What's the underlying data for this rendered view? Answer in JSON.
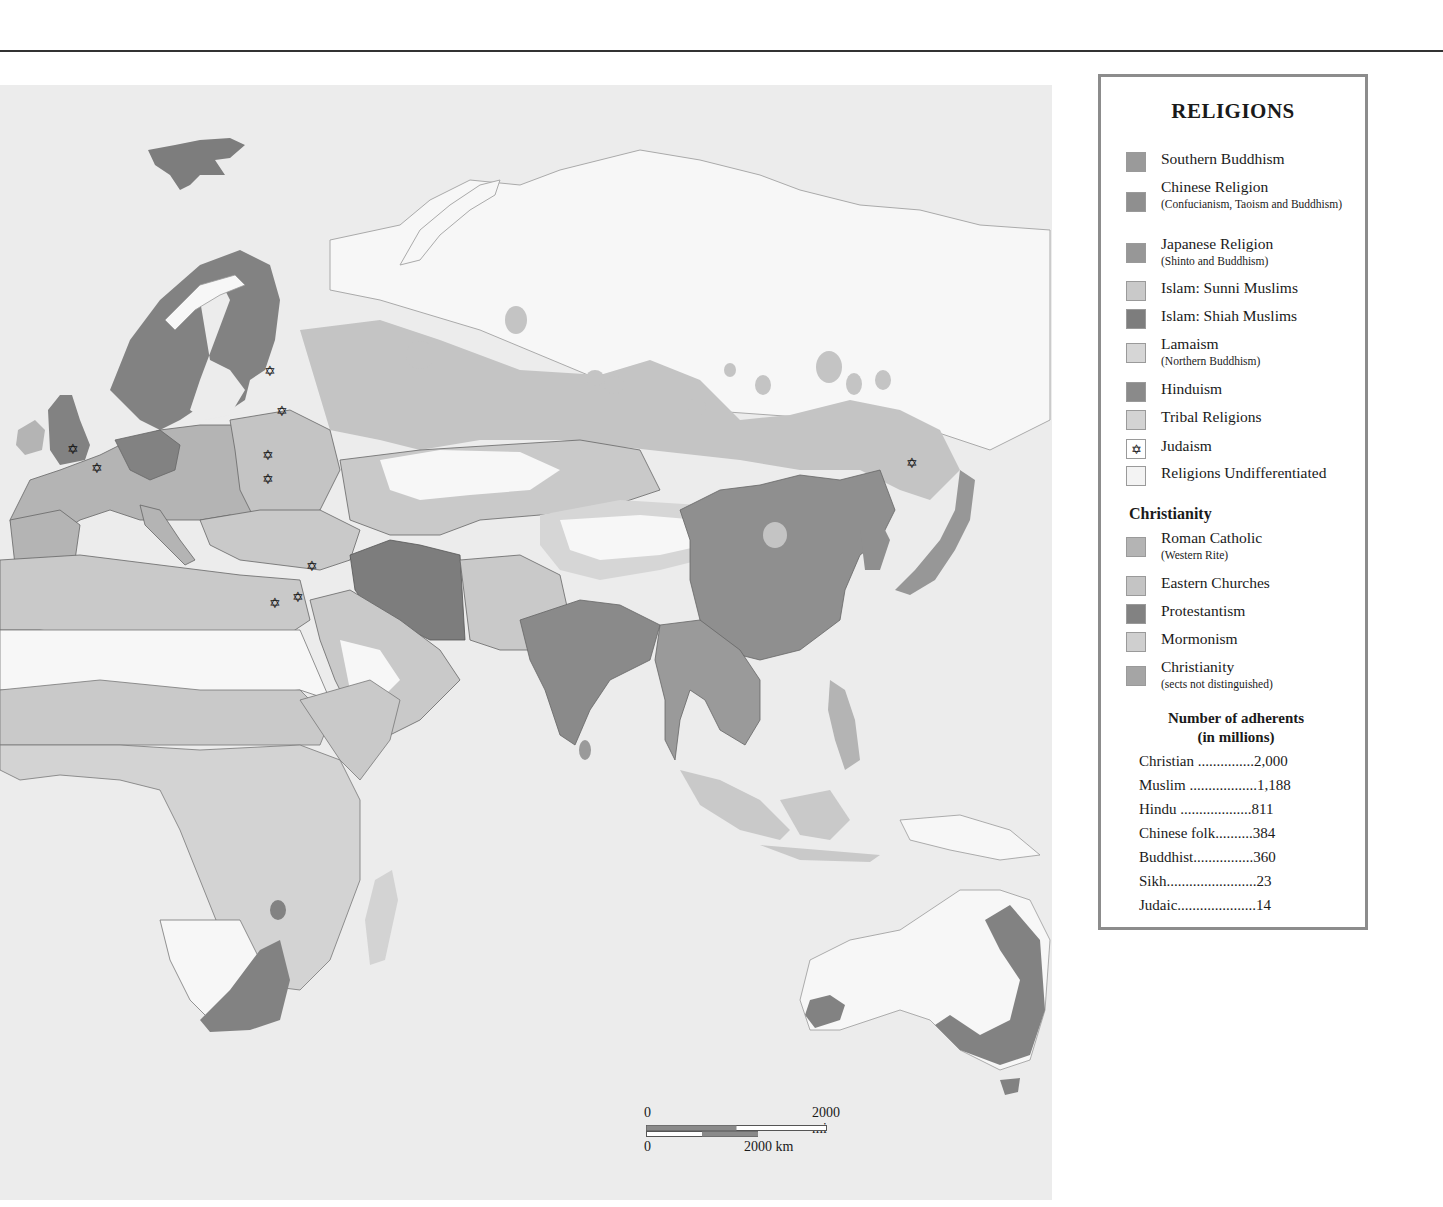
{
  "legend": {
    "title": "RELIGIONS",
    "items": [
      {
        "label": "Southern Buddhism",
        "sub": "",
        "color": "#9a9a9a"
      },
      {
        "label": "Chinese Religion",
        "sub": "(Confucianism, Taoism and Buddhism)",
        "color": "#8f8f8f"
      },
      {
        "label": "Japanese Religion",
        "sub": "(Shinto and Buddhism)",
        "color": "#979797"
      },
      {
        "label": "Islam:  Sunni Muslims",
        "sub": "",
        "color": "#c9c9c9"
      },
      {
        "label": "Islam:  Shiah Muslims",
        "sub": "",
        "color": "#7d7d7d"
      },
      {
        "label": "Lamaism",
        "sub": "(Northern Buddhism)",
        "color": "#d6d6d6"
      },
      {
        "label": "Hinduism",
        "sub": "",
        "color": "#8a8a8a"
      },
      {
        "label": "Tribal Religions",
        "sub": "",
        "color": "#d3d3d3"
      },
      {
        "label": "Judaism",
        "sub": "",
        "color": "#ffffff",
        "icon": "✡"
      },
      {
        "label": "Religions Undifferentiated",
        "sub": "",
        "color": "#f3f3f3"
      }
    ],
    "christianity_heading": "Christianity",
    "christianity_items": [
      {
        "label": "Roman Catholic",
        "sub": "(Western Rite)",
        "color": "#b4b4b4"
      },
      {
        "label": "Eastern Churches",
        "sub": "",
        "color": "#c4c4c4"
      },
      {
        "label": "Protestantism",
        "sub": "",
        "color": "#828282"
      },
      {
        "label": "Mormonism",
        "sub": "",
        "color": "#cfcfcf"
      },
      {
        "label": "Christianity",
        "sub": "(sects not distinguished)",
        "color": "#a5a5a5"
      }
    ],
    "adherents_title_1": "Number of adherents",
    "adherents_title_2": "(in millions)",
    "adherents": [
      {
        "name": "Christian",
        "dots": " ...............",
        "value": "2,000"
      },
      {
        "name": "Muslim",
        "dots": " ..................",
        "value": "1,188"
      },
      {
        "name": "Hindu",
        "dots": " ...................",
        "value": "811"
      },
      {
        "name": "Chinese folk",
        "dots": "..........",
        "value": "384"
      },
      {
        "name": "Buddhist",
        "dots": "................",
        "value": "360"
      },
      {
        "name": "Sikh",
        "dots": "........................",
        "value": "23"
      },
      {
        "name": "Judaic",
        "dots": ".....................",
        "value": "14"
      }
    ]
  },
  "scale": {
    "mi_zero": "0",
    "mi_label": "2000 mi",
    "km_zero": "0",
    "km_label": "2000 km"
  },
  "judaism_markers": [
    {
      "x": 73,
      "y": 450
    },
    {
      "x": 97,
      "y": 469
    },
    {
      "x": 270,
      "y": 372
    },
    {
      "x": 282,
      "y": 412
    },
    {
      "x": 268,
      "y": 456
    },
    {
      "x": 268,
      "y": 480
    },
    {
      "x": 312,
      "y": 567
    },
    {
      "x": 298,
      "y": 598
    },
    {
      "x": 275,
      "y": 604
    },
    {
      "x": 912,
      "y": 464
    }
  ],
  "star_glyph": "✡",
  "colors": {
    "map_bg": "#ececec",
    "land_undiff": "#f7f7f7",
    "legend_border": "#8c8c8c"
  }
}
